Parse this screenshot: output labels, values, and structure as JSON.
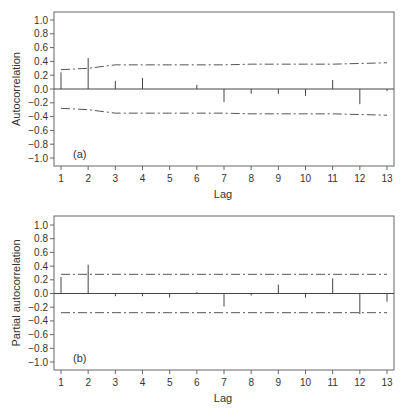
{
  "chart_data": [
    {
      "type": "bar",
      "subtype": "acf-stem",
      "panel_label": "(a)",
      "title": "",
      "xlabel": "Lag",
      "ylabel": "Autocorrelation",
      "ylim": [
        -1.0,
        1.0
      ],
      "xlim": [
        1,
        13
      ],
      "yticks": [
        "1.0",
        "0.8",
        "0.6",
        "0.4",
        "0.2",
        "0.0",
        "−0.2",
        "−0.4",
        "−0.6",
        "−0.8",
        "−1.0"
      ],
      "ytick_values": [
        1.0,
        0.8,
        0.6,
        0.4,
        0.2,
        0.0,
        -0.2,
        -0.4,
        -0.6,
        -0.8,
        -1.0
      ],
      "xticks": [
        "1",
        "2",
        "3",
        "4",
        "5",
        "6",
        "7",
        "8",
        "9",
        "10",
        "11",
        "12",
        "13"
      ],
      "categories": [
        1,
        2,
        3,
        4,
        5,
        6,
        7,
        8,
        9,
        10,
        11,
        12,
        13
      ],
      "values": [
        0.24,
        0.45,
        0.12,
        0.16,
        0.0,
        0.06,
        -0.19,
        -0.07,
        -0.07,
        -0.1,
        0.13,
        -0.22,
        -0.03
      ],
      "confidence_upper": [
        0.28,
        0.3,
        0.35,
        0.35,
        0.35,
        0.35,
        0.35,
        0.36,
        0.36,
        0.36,
        0.36,
        0.37,
        0.38
      ],
      "confidence_lower": [
        -0.28,
        -0.3,
        -0.35,
        -0.35,
        -0.35,
        -0.35,
        -0.35,
        -0.36,
        -0.36,
        -0.36,
        -0.36,
        -0.37,
        -0.38
      ],
      "grid": false
    },
    {
      "type": "bar",
      "subtype": "pacf-stem",
      "panel_label": "(b)",
      "title": "",
      "xlabel": "Lag",
      "ylabel": "Partial autocorrelation",
      "ylim": [
        -1.0,
        1.0
      ],
      "xlim": [
        1,
        13
      ],
      "yticks": [
        "1.0",
        "0.8",
        "0.6",
        "0.4",
        "0.2",
        "0.0",
        "−0.2",
        "−0.4",
        "−0.6",
        "−0.8",
        "−1.0"
      ],
      "ytick_values": [
        1.0,
        0.8,
        0.6,
        0.4,
        0.2,
        0.0,
        -0.2,
        -0.4,
        -0.6,
        -0.8,
        -1.0
      ],
      "xticks": [
        "1",
        "2",
        "3",
        "4",
        "5",
        "6",
        "7",
        "8",
        "9",
        "10",
        "11",
        "12",
        "13"
      ],
      "categories": [
        1,
        2,
        3,
        4,
        5,
        6,
        7,
        8,
        9,
        10,
        11,
        12,
        13
      ],
      "values": [
        0.24,
        0.42,
        -0.04,
        -0.04,
        -0.06,
        0.02,
        -0.19,
        -0.03,
        0.13,
        -0.06,
        0.22,
        -0.3,
        -0.12
      ],
      "confidence_upper": [
        0.28,
        0.28,
        0.28,
        0.28,
        0.28,
        0.28,
        0.28,
        0.28,
        0.28,
        0.28,
        0.28,
        0.28,
        0.28
      ],
      "confidence_lower": [
        -0.28,
        -0.28,
        -0.28,
        -0.28,
        -0.28,
        -0.28,
        -0.28,
        -0.28,
        -0.28,
        -0.28,
        -0.28,
        -0.28,
        -0.28
      ],
      "grid": false
    }
  ],
  "panels": {
    "a": {
      "label": "(a)",
      "ylabel": "Autocorrelation",
      "xlabel": "Lag"
    },
    "b": {
      "label": "(b)",
      "ylabel": "Partial autocorrelation",
      "xlabel": "Lag"
    }
  },
  "colors": {
    "axis": "#555555",
    "stem": "#444444",
    "band": "#555555",
    "text": "#333333"
  }
}
